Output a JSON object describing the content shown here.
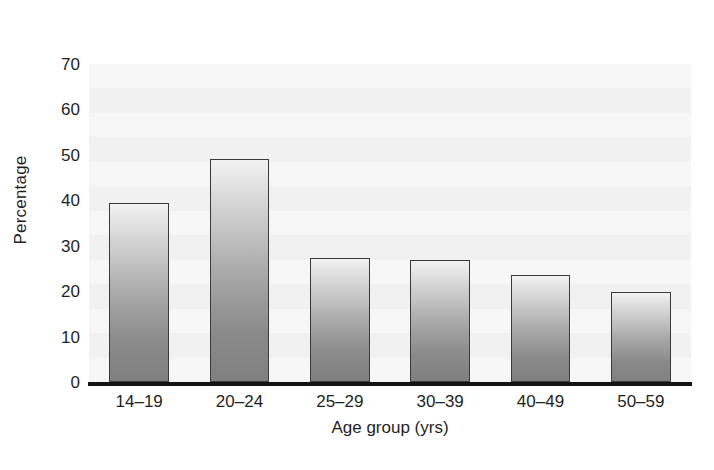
{
  "chart_data": {
    "type": "bar",
    "title": "",
    "subtitle": "",
    "xlabel": "Age group (yrs)",
    "ylabel": "Percentage",
    "categories": [
      "14–19",
      "20–24",
      "25–29",
      "30–39",
      "40–49",
      "50–59"
    ],
    "values": [
      39.5,
      49.0,
      27.3,
      26.8,
      23.5,
      19.8
    ],
    "ylim": [
      0,
      70
    ],
    "ytick_values": [
      0,
      10,
      20,
      30,
      40,
      50,
      60,
      70
    ],
    "ytick_labels": [
      "0",
      "10",
      "20",
      "30",
      "40",
      "50",
      "60",
      "70"
    ],
    "grid": false,
    "legend": null,
    "annotations": [],
    "colors": {
      "bar_top": "#f2f2f2",
      "bar_bottom": "#808080",
      "bar_outline": "#3a3a3a",
      "plot_background": "#f4f4f4",
      "axis_line": "#141414",
      "text": "#1f1f1f",
      "figure_background": "#ffffff"
    }
  }
}
